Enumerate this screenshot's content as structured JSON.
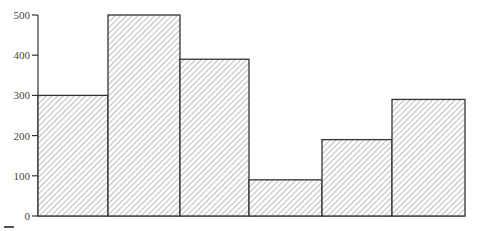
{
  "chart_data": {
    "type": "bar",
    "title": "",
    "xlabel": "",
    "ylabel": "",
    "categories": [
      "1",
      "2",
      "3",
      "4",
      "5",
      "6"
    ],
    "category_labels_visible": false,
    "values": [
      300,
      500,
      390,
      90,
      190,
      290
    ],
    "ylim": [
      0,
      500
    ],
    "yticks": [
      0,
      100,
      200,
      300,
      400,
      500
    ],
    "grid": false,
    "legend": null,
    "bar_style": "diagonal-hatch",
    "colors": {
      "outline": "#333333",
      "hatch": "#9a9a9a",
      "background": "#ffffff"
    }
  }
}
